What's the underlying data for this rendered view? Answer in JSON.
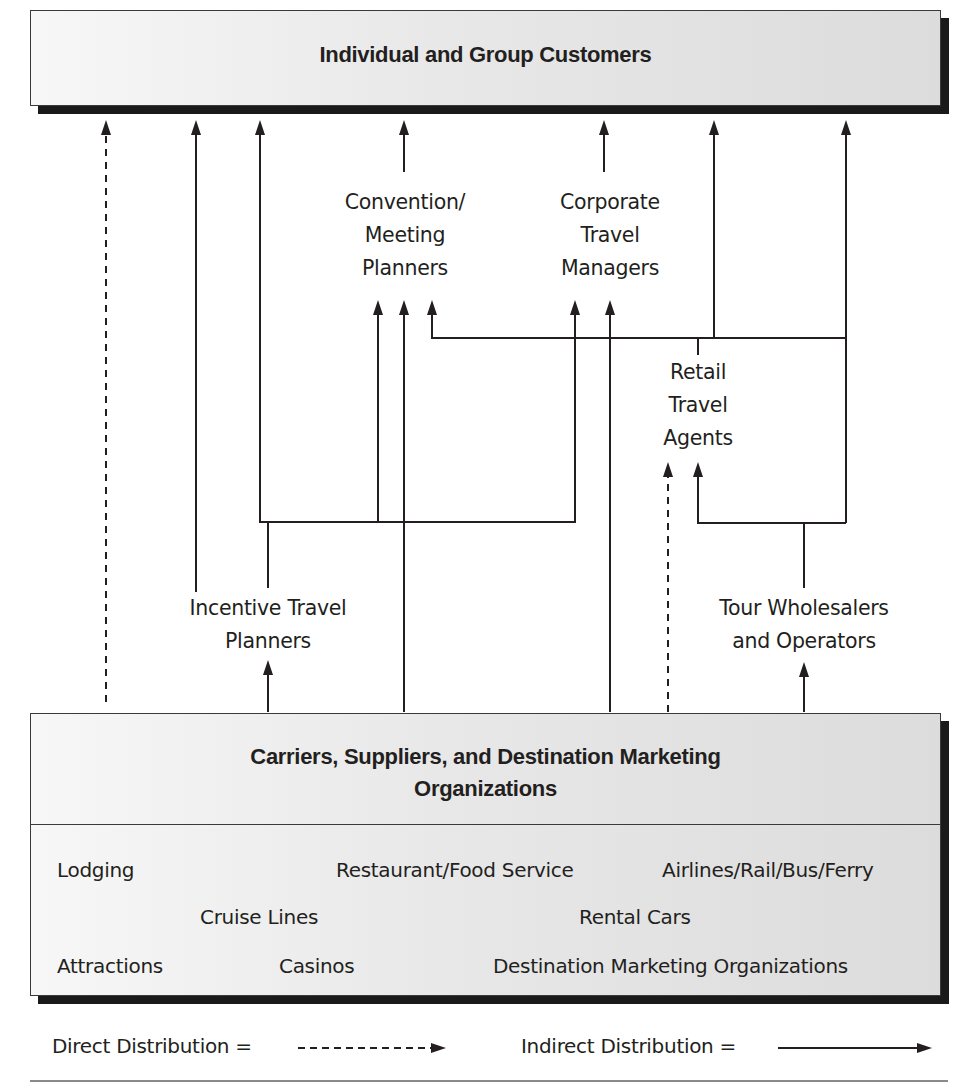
{
  "top_box": {
    "title": "Individual and Group Customers"
  },
  "intermediaries": {
    "convention": {
      "lines": [
        "Convention/",
        "Meeting",
        "Planners"
      ]
    },
    "corporate": {
      "lines": [
        "Corporate",
        "Travel",
        "Managers"
      ]
    },
    "retail": {
      "lines": [
        "Retail",
        "Travel",
        "Agents"
      ]
    },
    "incentive": {
      "lines": [
        "Incentive Travel",
        "Planners"
      ]
    },
    "tour": {
      "lines": [
        "Tour Wholesalers",
        "and Operators"
      ]
    }
  },
  "bottom_box": {
    "title_line1": "Carriers, Suppliers, and Destination Marketing",
    "title_line2": "Organizations",
    "items": [
      "Lodging",
      "Restaurant/Food Service",
      "Airlines/Rail/Bus/Ferry",
      "Cruise Lines",
      "Rental Cars",
      "Attractions",
      "Casinos",
      "Destination Marketing Organizations"
    ]
  },
  "legend": {
    "direct_label": "Direct Distribution =",
    "indirect_label": "Indirect Distribution ="
  },
  "colors": {
    "line": "#231f20",
    "box_fill": "#e4e4e4",
    "shadow": "#1a1a1a",
    "rule": "#8a8a8a"
  }
}
